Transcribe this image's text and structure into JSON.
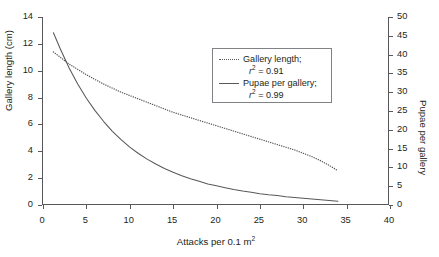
{
  "chart_data": {
    "type": "line",
    "title": "",
    "xlabel": "Attacks per 0.1 m2",
    "xlabel_base": "Attacks per 0.1 m",
    "xlabel_sup": "2",
    "ylabel": "Gallery length (cm)",
    "ylabel_secondary": "Pupae per gallery",
    "xlim": [
      0,
      40
    ],
    "ylim": [
      0,
      14
    ],
    "ylim_secondary": [
      0,
      50
    ],
    "xticks": [
      "0",
      "5",
      "10",
      "15",
      "20",
      "25",
      "30",
      "35",
      "40"
    ],
    "yticks": [
      "0",
      "2",
      "4",
      "6",
      "8",
      "10",
      "12",
      "14"
    ],
    "yticks_secondary": [
      "0",
      "5",
      "10",
      "15",
      "20",
      "25",
      "30",
      "35",
      "40",
      "45",
      "50"
    ],
    "grid": false,
    "legend_position": "upper-center",
    "series": [
      {
        "name": "Gallery length",
        "axis": "left",
        "style": "dotted",
        "color": "#58585b",
        "r_squared": "0.91",
        "x": [
          1.2,
          2,
          3,
          4,
          5,
          6,
          7,
          8,
          9,
          10,
          11,
          12,
          13,
          14,
          15,
          16,
          17,
          18,
          19,
          20,
          21,
          22,
          23,
          24,
          25,
          26,
          27,
          28,
          29,
          30,
          31,
          32,
          33,
          34
        ],
        "y": [
          11.4,
          11.0,
          10.5,
          10.1,
          9.7,
          9.35,
          9.0,
          8.7,
          8.4,
          8.15,
          7.9,
          7.65,
          7.4,
          7.15,
          6.9,
          6.7,
          6.5,
          6.3,
          6.1,
          5.9,
          5.7,
          5.5,
          5.3,
          5.1,
          4.9,
          4.7,
          4.5,
          4.3,
          4.1,
          3.85,
          3.6,
          3.3,
          2.95,
          2.55
        ]
      },
      {
        "name": "Pupae per gallery",
        "axis": "right",
        "style": "solid",
        "color": "#58585b",
        "r_squared": "0.99",
        "x": [
          1.2,
          2,
          3,
          4,
          5,
          6,
          7,
          8,
          9,
          10,
          11,
          12,
          13,
          14,
          15,
          16,
          17,
          18,
          19,
          20,
          21,
          22,
          23,
          24,
          25,
          26,
          27,
          28,
          29,
          30,
          31,
          32,
          33,
          34
        ],
        "y": [
          45.8,
          41.5,
          36.5,
          32.2,
          28.4,
          25.1,
          22.2,
          19.6,
          17.4,
          15.4,
          13.7,
          12.2,
          10.9,
          9.7,
          8.7,
          7.8,
          7.0,
          6.3,
          5.6,
          5.1,
          4.6,
          4.1,
          3.7,
          3.4,
          3.0,
          2.7,
          2.5,
          2.2,
          2.0,
          1.8,
          1.6,
          1.4,
          1.2,
          1.0
        ]
      }
    ],
    "legend": [
      {
        "label": "Gallery length;",
        "r2_prefix": "r",
        "r2_sup": "2",
        "r2_value": "= 0.91",
        "style": "dotted"
      },
      {
        "label": "Pupae per gallery;",
        "r2_prefix": "r",
        "r2_sup": "2",
        "r2_value": "= 0.99",
        "style": "solid"
      }
    ]
  }
}
